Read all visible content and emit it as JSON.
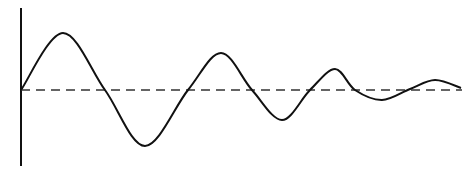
{
  "diagram": {
    "type": "damped-oscillation",
    "colors": {
      "background": "#ffffff",
      "stroke": "#111111"
    },
    "axis": {
      "x": 21,
      "y_top": 8,
      "y_bottom": 166
    },
    "baseline": {
      "y": 90,
      "x_start": 21,
      "x_end": 462,
      "style": "dashed"
    },
    "curve_keypoints": [
      {
        "x": 21,
        "y": 90,
        "kind": "start"
      },
      {
        "x": 63,
        "y": 33,
        "kind": "peak"
      },
      {
        "x": 105,
        "y": 90,
        "kind": "zero"
      },
      {
        "x": 145,
        "y": 146,
        "kind": "trough"
      },
      {
        "x": 188,
        "y": 90,
        "kind": "zero"
      },
      {
        "x": 221,
        "y": 53,
        "kind": "peak"
      },
      {
        "x": 252,
        "y": 90,
        "kind": "zero"
      },
      {
        "x": 282,
        "y": 120,
        "kind": "trough"
      },
      {
        "x": 310,
        "y": 90,
        "kind": "zero"
      },
      {
        "x": 335,
        "y": 69,
        "kind": "peak"
      },
      {
        "x": 355,
        "y": 90,
        "kind": "zero"
      },
      {
        "x": 382,
        "y": 100,
        "kind": "trough"
      },
      {
        "x": 410,
        "y": 89,
        "kind": "zero"
      },
      {
        "x": 435,
        "y": 80,
        "kind": "peak"
      },
      {
        "x": 461,
        "y": 88,
        "kind": "end"
      }
    ]
  }
}
